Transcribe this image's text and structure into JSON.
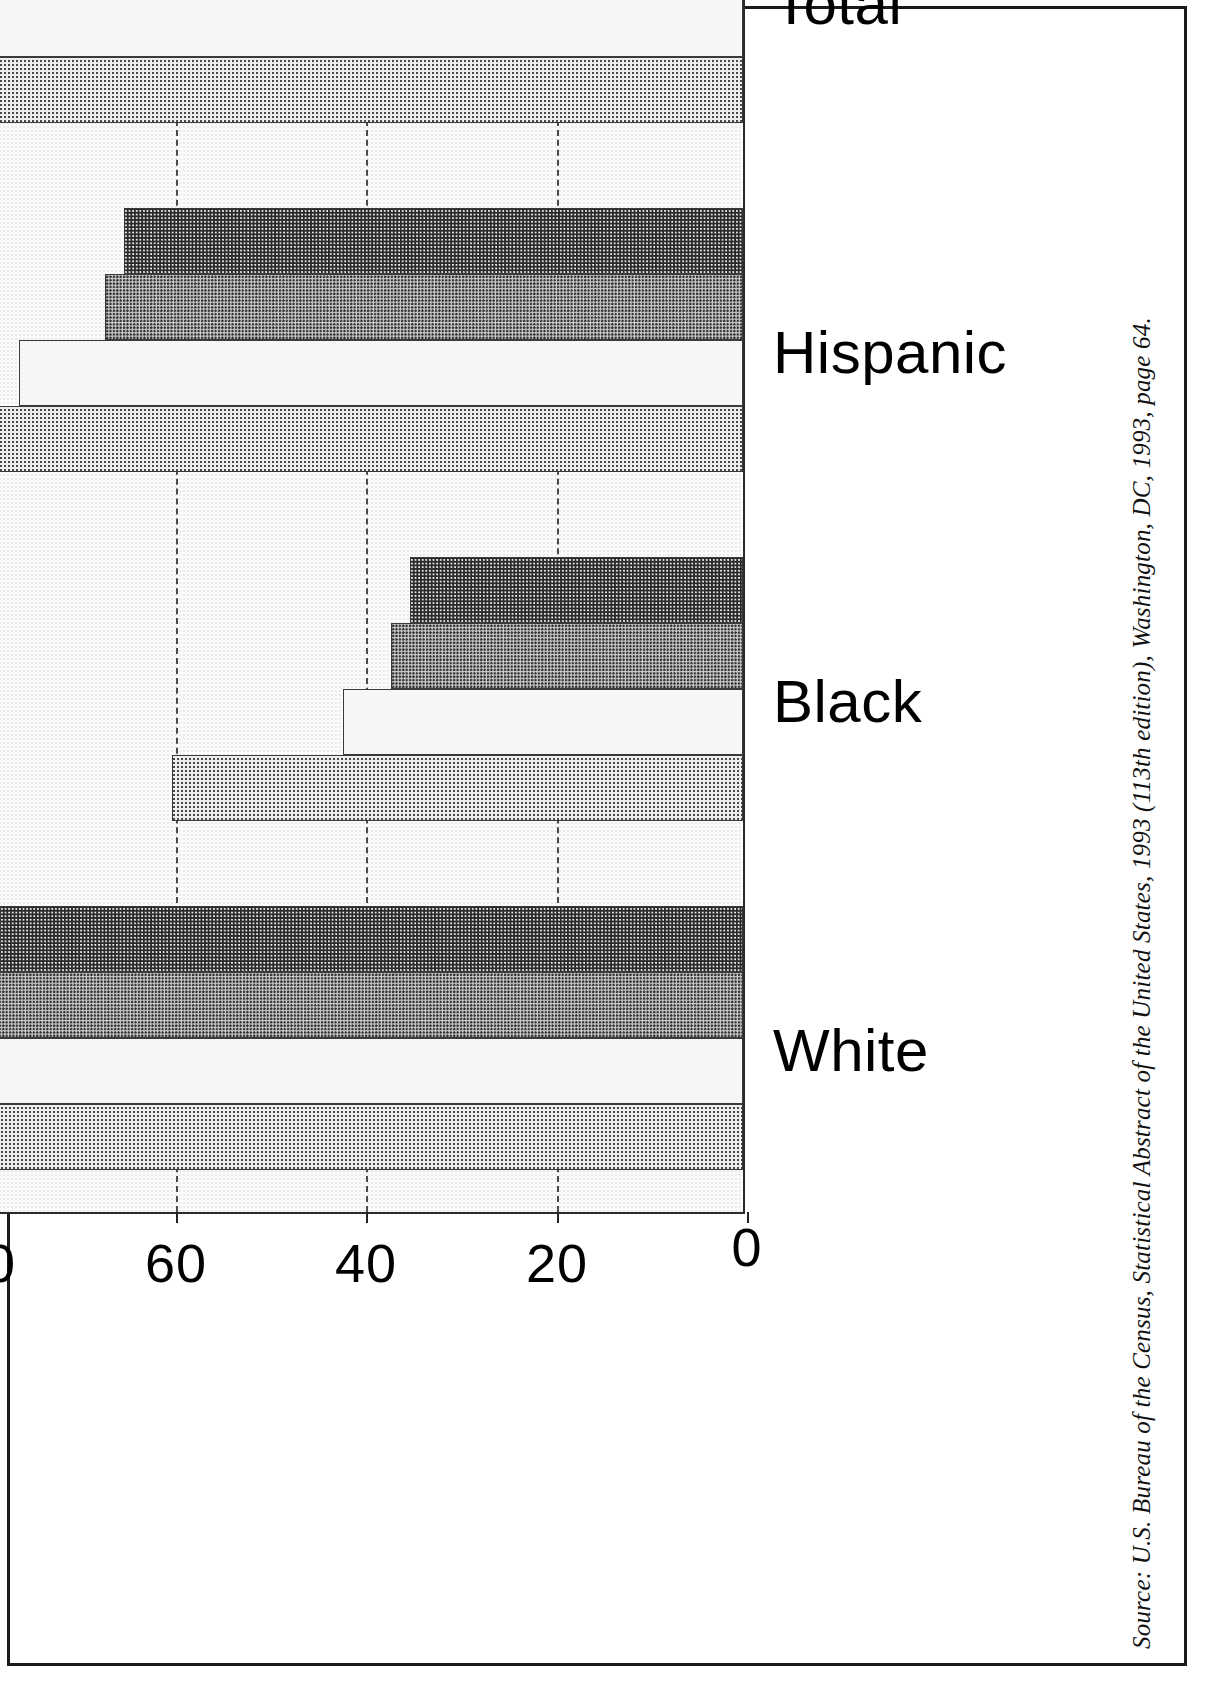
{
  "figure": {
    "orientation": "rotated-90-ccw",
    "source_note": "Source: U.S. Bureau of the Census, Statistical Abstract of the United States, 1993 (113th edition), Washington, DC, 1993, page 64."
  },
  "legend": {
    "position": "inside-plot-top-right",
    "entries": [
      {
        "label": "1970",
        "swatch": "light-dotted",
        "color": "#ededed"
      },
      {
        "label": "1980",
        "swatch": "very-light-dotted",
        "color": "#f6f6f6"
      },
      {
        "label": "1990",
        "swatch": "medium-gray-halftone",
        "color": "#c9c9c9"
      },
      {
        "label": "1992",
        "swatch": "dark-halftone",
        "color": "#2a2a2a"
      }
    ]
  },
  "axis": {
    "value_ticks": [
      "0",
      "20",
      "40",
      "60",
      "80",
      "100"
    ],
    "category_labels": [
      "White",
      "Black",
      "Hispanic",
      "Total"
    ]
  },
  "chart_data": {
    "type": "bar",
    "title": "",
    "subtitle": "",
    "xlabel": "",
    "ylabel": "",
    "orientation": "horizontal",
    "categories": [
      "White",
      "Black",
      "Hispanic",
      "Total"
    ],
    "series": [
      {
        "name": "1970",
        "values": [
          89,
          60,
          79,
          87
        ]
      },
      {
        "name": "1980",
        "values": [
          85,
          42,
          76,
          83
        ]
      },
      {
        "name": "1990",
        "values": [
          79,
          37,
          67,
          75
        ]
      },
      {
        "name": "1992",
        "values": [
          78,
          35,
          65,
          73
        ]
      }
    ],
    "ylim": [
      0,
      100
    ],
    "yticks": [
      0,
      20,
      40,
      60,
      80,
      100
    ],
    "grid": "dashed-vertical-at-value-ticks",
    "legend_position": "top-right-inside-plot",
    "annotations": []
  }
}
